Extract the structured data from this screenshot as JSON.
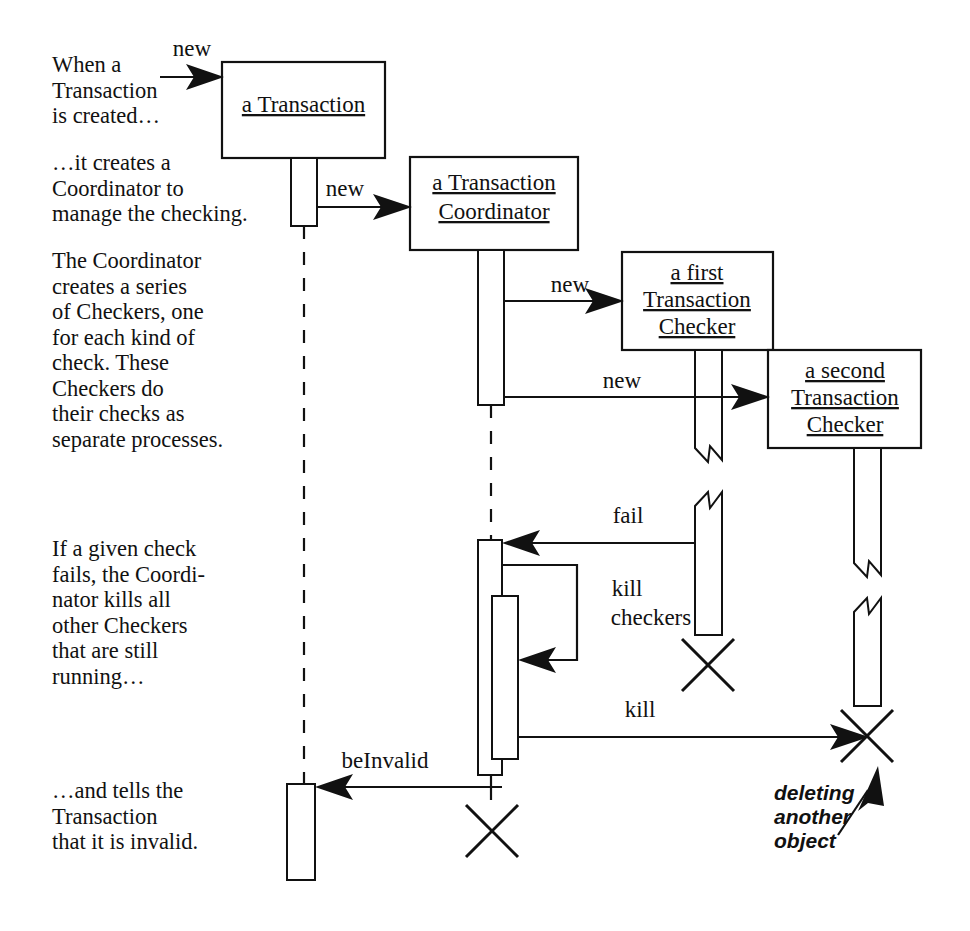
{
  "diagram": {
    "kind": "sequence-diagram",
    "colors": {
      "ink": "#111111",
      "paper": "#ffffff"
    }
  },
  "narration": {
    "block1": "When a\nTransaction\nis created…",
    "block2": "…it creates a\nCoordinator to\nmanage the checking.",
    "block3": "The Coordinator\ncreates a series\nof Checkers, one\nfor each kind of\ncheck. These\nCheckers do\ntheir checks as\nseparate processes.",
    "block4": "If a given check\nfails, the Coordi-\nnator kills all\nother Checkers\nthat are still\nrunning…",
    "block5": "…and tells the\nTransaction\nthat it is invalid."
  },
  "objects": [
    {
      "id": "transaction",
      "label_line1": "a Transaction",
      "label_line2": ""
    },
    {
      "id": "coordinator",
      "label_line1": "a Transaction",
      "label_line2": "Coordinator"
    },
    {
      "id": "checker1",
      "label_line1": "a first",
      "label_line2": "Transaction",
      "label_line3": "Checker"
    },
    {
      "id": "checker2",
      "label_line1": "a second",
      "label_line2": "Transaction",
      "label_line3": "Checker"
    }
  ],
  "messages": [
    {
      "id": "create-transaction",
      "label": "new"
    },
    {
      "id": "create-coordinator",
      "label": "new"
    },
    {
      "id": "create-checker1",
      "label": "new"
    },
    {
      "id": "create-checker2",
      "label": "new"
    },
    {
      "id": "fail",
      "label": "fail"
    },
    {
      "id": "kill-checkers-self",
      "label_line1": "kill",
      "label_line2": "checkers"
    },
    {
      "id": "kill",
      "label": "kill"
    },
    {
      "id": "be-invalid",
      "label": "beInvalid"
    }
  ],
  "annotations": {
    "deleting": {
      "line1": "deleting",
      "line2": "another",
      "line3": "object"
    }
  }
}
